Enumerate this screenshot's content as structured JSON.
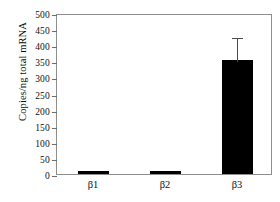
{
  "chart_data": {
    "type": "bar",
    "title": "",
    "subtitle": "",
    "xlabel": "",
    "ylabel": "Copies/ng total mRNA",
    "categories": [
      "β1",
      "β2",
      "β3"
    ],
    "values": [
      4,
      4,
      355
    ],
    "errors": [
      2,
      2,
      75
    ],
    "error_type": "upper",
    "ylim": [
      0,
      500
    ],
    "yticks": [
      0,
      50,
      100,
      150,
      200,
      250,
      300,
      350,
      400,
      450,
      500
    ],
    "ytick_labels": [
      "0",
      "50",
      "100",
      "150",
      "200",
      "250",
      "300",
      "350",
      "400",
      "450",
      "500"
    ],
    "grid": false,
    "legend": null,
    "legend_position": "none",
    "bar_color": "#000000",
    "frame_color": "#8e8e8e",
    "series": [
      {
        "name": "Copies/ng total mRNA",
        "values": [
          4,
          4,
          355
        ],
        "errors": [
          2,
          2,
          75
        ]
      }
    ],
    "annotations": []
  }
}
